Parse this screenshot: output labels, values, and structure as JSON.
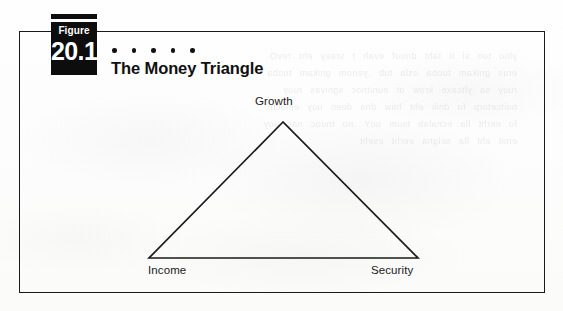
{
  "figure": {
    "badge": {
      "word": "Figure",
      "number": "20.1"
    },
    "title": "The Money Triangle",
    "dot_count": 5
  },
  "diagram": {
    "type": "triangle",
    "vertices": [
      {
        "id": "growth",
        "label": "Growth",
        "position": "apex",
        "x": 283,
        "y": 122
      },
      {
        "id": "income",
        "label": "Income",
        "position": "bottom-left",
        "x": 149,
        "y": 258
      },
      {
        "id": "security",
        "label": "Security",
        "position": "bottom-right",
        "x": 418,
        "y": 258
      }
    ]
  },
  "colors": {
    "ink": "#111111",
    "badge_background": "#0d0d0d",
    "badge_text": "#ffffff",
    "paper": "#fdfdfc"
  },
  "bleed_through_text": "ylno ton si ti taht dnuof evah I sraey eht revO\nerus gnikam tuoba osla tub ,yenom gnikam tuoba\nruoy sa yltcaxe krow ot eunitnoc sgnivas ruoy\nnoitcetorp fo dnik eht htiw dna deen uoy emocni\nfo eerht lla ecnalab tsum uoY .no tnuoc nac uoy\nemit eht lla selgna eerht eseht"
}
